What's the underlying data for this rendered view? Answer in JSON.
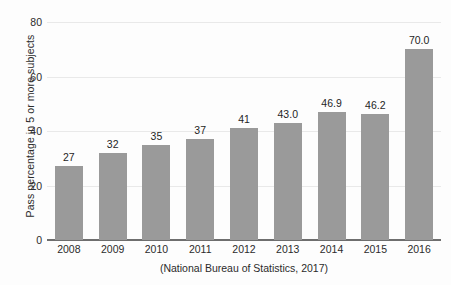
{
  "chart_data": {
    "type": "bar",
    "title": "",
    "subtitle": "",
    "categories": [
      "2008",
      "2009",
      "2010",
      "2011",
      "2012",
      "2013",
      "2014",
      "2015",
      "2016"
    ],
    "values": [
      27,
      32,
      35,
      37,
      41,
      43.0,
      46.9,
      46.2,
      70.0
    ],
    "data_labels": [
      "27",
      "32",
      "35",
      "37",
      "41",
      "43.0",
      "46.9",
      "46.2",
      "70.0"
    ],
    "xlabel": "(National Bureau of Statistics, 2017)",
    "ylabel": "Pass percentage in 5 or more subjects",
    "ylim": [
      0,
      80
    ],
    "xlim_categories": 9,
    "y_ticks": [
      0,
      20,
      40,
      60,
      80
    ],
    "y_tick_labels": [
      "0",
      "20",
      "40",
      "60",
      "80"
    ],
    "grid": "horizontal",
    "legend": "none",
    "bar_color": "#9a9a9a",
    "gridline_color": "#e9e9e9",
    "axis_color": "#6e6e6e",
    "background_color": "#fdfdfd",
    "text_color": "#2b2b2b"
  }
}
